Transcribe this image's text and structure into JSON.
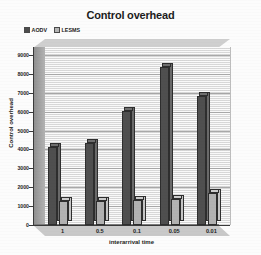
{
  "chart_data": {
    "type": "bar",
    "title": "Control overhead",
    "xlabel": "interarrival time",
    "ylabel": "Control overhead",
    "categories": [
      "1",
      "0.5",
      "0.1",
      "0.05",
      "0.01"
    ],
    "series": [
      {
        "name": "AODV",
        "values": [
          4150,
          4350,
          6050,
          8350,
          6850
        ],
        "color": "#4f4f4f"
      },
      {
        "name": "LESMS",
        "values": [
          1250,
          1250,
          1350,
          1400,
          1700
        ],
        "color": "#b2b2b2"
      }
    ],
    "ylim": [
      0,
      9000
    ],
    "yticks": [
      0,
      1000,
      2000,
      3000,
      4000,
      5000,
      6000,
      7000,
      8000,
      9000
    ],
    "ytick_labels": [
      "0",
      "1000",
      "2000",
      "3000",
      "4000",
      "5000",
      "6000",
      "7000",
      "8000",
      "9000"
    ],
    "grid": true,
    "grid_axis": "y",
    "legend_position": "top-left",
    "style": "3d-column",
    "plot_background": "#e4e4e4"
  },
  "legend": {
    "items": [
      {
        "label": "AODV"
      },
      {
        "label": "LESMS"
      }
    ]
  }
}
